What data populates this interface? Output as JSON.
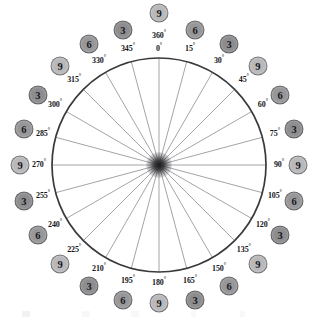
{
  "diagram": {
    "type": "radial-wheel",
    "geometry": {
      "center_x": 159,
      "center_y": 165,
      "radius": 107,
      "spoke_count": 24,
      "step_degrees": 15,
      "circle_color": "#3a3a3d",
      "spoke_color": "#9a9a9d"
    },
    "top_extra_label": {
      "degrees": "360",
      "suffix": "°",
      "value": "9"
    },
    "marks": [
      {
        "degrees": "0",
        "suffix": "°",
        "value": "9",
        "angle": 0
      },
      {
        "degrees": "15",
        "suffix": "°",
        "value": "6",
        "angle": 15
      },
      {
        "degrees": "30",
        "suffix": "°",
        "value": "3",
        "angle": 30
      },
      {
        "degrees": "45",
        "suffix": "°",
        "value": "9",
        "angle": 45
      },
      {
        "degrees": "60",
        "suffix": "°",
        "value": "6",
        "angle": 60
      },
      {
        "degrees": "75",
        "suffix": "°",
        "value": "3",
        "angle": 75
      },
      {
        "degrees": "90",
        "suffix": "°",
        "value": "9",
        "angle": 90
      },
      {
        "degrees": "105",
        "suffix": "°",
        "value": "6",
        "angle": 105
      },
      {
        "degrees": "120",
        "suffix": "°",
        "value": "3",
        "angle": 120
      },
      {
        "degrees": "135",
        "suffix": "°",
        "value": "9",
        "angle": 135
      },
      {
        "degrees": "150",
        "suffix": "°",
        "value": "6",
        "angle": 150
      },
      {
        "degrees": "165",
        "suffix": "°",
        "value": "3",
        "angle": 165
      },
      {
        "degrees": "180",
        "suffix": "°",
        "value": "9",
        "angle": 180
      },
      {
        "degrees": "195",
        "suffix": "°",
        "value": "6",
        "angle": 195
      },
      {
        "degrees": "210",
        "suffix": "°",
        "value": "3",
        "angle": 210
      },
      {
        "degrees": "225",
        "suffix": "°",
        "value": "9",
        "angle": 225
      },
      {
        "degrees": "240",
        "suffix": "°",
        "value": "6",
        "angle": 240
      },
      {
        "degrees": "255",
        "suffix": "°",
        "value": "3",
        "angle": 255
      },
      {
        "degrees": "270",
        "suffix": "°",
        "value": "9",
        "angle": 270
      },
      {
        "degrees": "285",
        "suffix": "°",
        "value": "6",
        "angle": 285
      },
      {
        "degrees": "300",
        "suffix": "°",
        "value": "3",
        "angle": 300
      },
      {
        "degrees": "315",
        "suffix": "°",
        "value": "9",
        "angle": 315
      },
      {
        "degrees": "330",
        "suffix": "°",
        "value": "6",
        "angle": 330
      },
      {
        "degrees": "345",
        "suffix": "°",
        "value": "3",
        "angle": 345
      }
    ],
    "colors": {
      "badge_3": "#8d8d90",
      "badge_6": "#97979a",
      "badge_9": "#b9b9bb",
      "text": "#16161a",
      "background": "#ffffff"
    }
  }
}
